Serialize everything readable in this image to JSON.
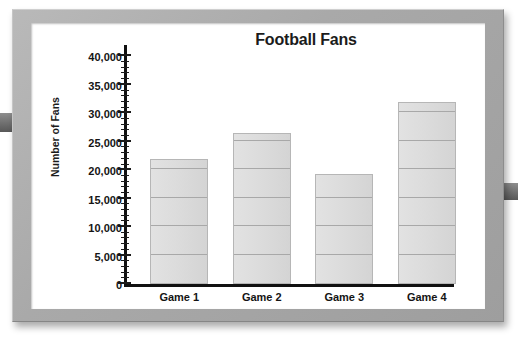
{
  "frame": {
    "left_tab_name": "frame-tab-left",
    "right_tab_name": "frame-tab-right"
  },
  "chart_data": {
    "type": "bar",
    "title": "Football Fans",
    "xlabel": "",
    "ylabel": "Number of Fans",
    "categories": [
      "Game 1",
      "Game 2",
      "Game 3",
      "Game 4"
    ],
    "values": [
      22000,
      26500,
      19300,
      32000
    ],
    "ylim": [
      0,
      42000
    ],
    "ytick_values": [
      0,
      5000,
      10000,
      15000,
      20000,
      25000,
      30000,
      35000,
      40000
    ],
    "ytick_labels": [
      "0",
      "5,000",
      "10,000",
      "15,000",
      "20,000",
      "25,000",
      "30,000",
      "35,000",
      "40,000"
    ],
    "minor_tick_interval": 1000,
    "grid": false,
    "legend": null,
    "bar_fill_color": "#dcdcdc",
    "bar_border_color": "#b6b6b6",
    "segment_line_color": "#a8a8a8",
    "segment_interval": 5000,
    "axis_color": "#111111",
    "frame_color": "#a9a9a9",
    "background_color": "#ffffff"
  }
}
